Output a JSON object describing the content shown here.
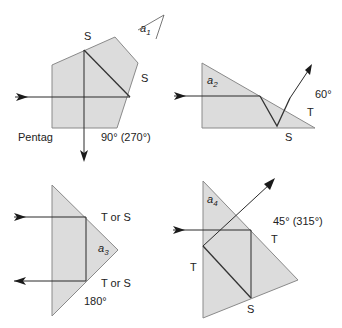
{
  "diagram": {
    "panels": [
      {
        "id": "pentaprism",
        "name_label": "Pentag",
        "angle_label": "a",
        "angle_sub": "1",
        "surface_labels": [
          "S",
          "S"
        ],
        "deviation_label": "90° (270°)"
      },
      {
        "id": "prism-a2",
        "angle_label": "a",
        "angle_sub": "2",
        "surface_labels": [
          "S",
          "T"
        ],
        "deviation_label": "60°"
      },
      {
        "id": "prism-a3",
        "angle_label": "a",
        "angle_sub": "3",
        "surface_labels": [
          "T or S",
          "T or S"
        ],
        "deviation_label": "180°"
      },
      {
        "id": "prism-a4",
        "angle_label": "a",
        "angle_sub": "4",
        "surface_labels": [
          "T",
          "T",
          "S"
        ],
        "deviation_label": "45° (315°)"
      }
    ],
    "colors": {
      "prism_fill": "#dcdcdc",
      "prism_stroke": "#8a8a8a",
      "ray": "#2a2a2a",
      "text": "#222222"
    }
  }
}
